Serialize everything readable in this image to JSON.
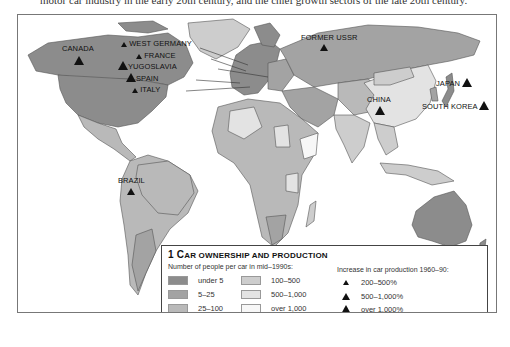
{
  "caption": "motor car industry in the early 20th century, and the chief growth sectors of the late 20th century.",
  "colors": {
    "under_5": "#8c8c8c",
    "5_25": "#a3a3a3",
    "25_100": "#b9b9b9",
    "100_500": "#cdcdcd",
    "500_1000": "#e3e3e3",
    "over_1000": "#f7f7f7",
    "ocean": "#ffffff",
    "border": "#555555"
  },
  "map_labels": {
    "canada": "CANADA",
    "west_germany": "WEST GERMANY",
    "france": "FRANCE",
    "yugoslavia": "YUGOSLAVIA",
    "spain": "SPAIN",
    "italy": "ITALY",
    "former_ussr": "FORMER USSR",
    "china": "CHINA",
    "japan": "JAPAN",
    "south_korea": "SOUTH KOREA",
    "brazil": "BRAZIL"
  },
  "legend": {
    "number": "1",
    "title_first": "C",
    "title_rest": "AR OWNERSHIP AND PRODUCTION",
    "ownership_heading": "Number of people per car in mid–1990s:",
    "ownership_items": [
      {
        "label": "under 5"
      },
      {
        "label": "5–25"
      },
      {
        "label": "25–100"
      },
      {
        "label": "100–500"
      },
      {
        "label": "500–1,000"
      },
      {
        "label": "over 1,000"
      }
    ],
    "production_heading": "Increase in car production 1960–90:",
    "production_items": [
      {
        "label": "200–500%",
        "size": "small"
      },
      {
        "label": "500–1,000%",
        "size": "medium"
      },
      {
        "label": "over 1,000%",
        "size": "large"
      }
    ]
  }
}
